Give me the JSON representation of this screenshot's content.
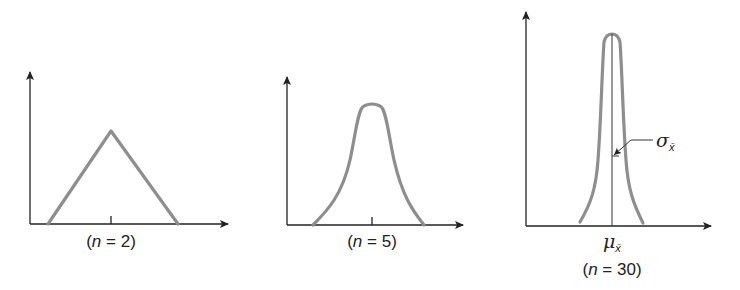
{
  "figure": {
    "panels": [
      {
        "id": "n2",
        "label": "(n = 2)",
        "n": "2",
        "shape": "triangular"
      },
      {
        "id": "n5",
        "label": "(n = 5)",
        "n": "5",
        "shape": "bell"
      },
      {
        "id": "n30",
        "label": "(n = 30)",
        "n": "30",
        "shape": "narrow-bell"
      }
    ],
    "annotations": {
      "sigma_symbol": "σ",
      "mu_symbol": "μ",
      "xbar_subscript": "x̄"
    },
    "colors": {
      "curve": "#8e8e8e",
      "axis": "#222222"
    }
  },
  "text": {
    "n2_open": "(",
    "n2_n": "n",
    "n2_rest": " = 2)",
    "n5_open": "(",
    "n5_n": "n",
    "n5_rest": " = 5)",
    "n30_open": "(",
    "n30_n": "n",
    "n30_rest": " = 30)",
    "sigma": "σ",
    "mu": "μ",
    "sub": "x̄"
  }
}
